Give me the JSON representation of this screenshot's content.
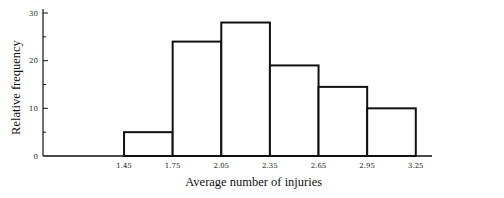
{
  "chart_data": {
    "type": "bar",
    "subtype": "histogram",
    "title": "",
    "xlabel": "Average number of injuries",
    "ylabel": "Relative frequency",
    "bin_edges": [
      1.45,
      1.75,
      2.05,
      2.35,
      2.65,
      2.95,
      3.25
    ],
    "x_tick_labels": [
      "1.45",
      "1.75",
      "2.05",
      "2.35",
      "2.65",
      "2.95",
      "3.25"
    ],
    "values": [
      5,
      24,
      28,
      19,
      14.5,
      10
    ],
    "y_ticks": [
      0,
      10,
      20,
      30
    ],
    "y_minor_ticks": [
      5,
      15,
      25
    ],
    "y_tick_labels": [
      "0",
      "10",
      "20",
      "30"
    ],
    "ylim": [
      0,
      30
    ],
    "xlim": [
      0.95,
      3.35
    ],
    "grid": false,
    "legend": "none"
  }
}
